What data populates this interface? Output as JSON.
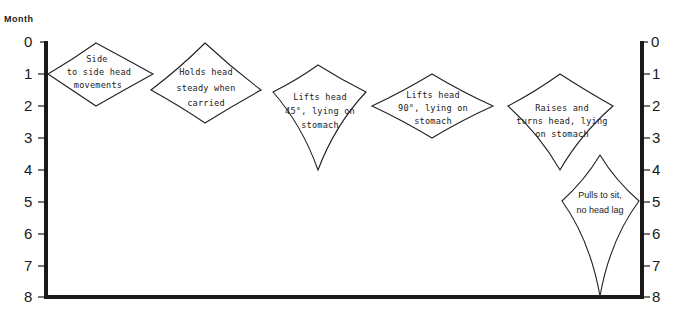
{
  "diagram": {
    "axis_title": "Month",
    "left_ticks": [
      "0",
      "1",
      "2",
      "3",
      "4",
      "5",
      "6",
      "7",
      "8"
    ],
    "right_ticks": [
      "0",
      "1",
      "2",
      "3",
      "4",
      "5",
      "6",
      "7",
      "8"
    ],
    "milestones": [
      {
        "id": "side-to-side",
        "lines": [
          "Side",
          "to side head",
          "movements"
        ],
        "start_month": 0,
        "peak_month": 1,
        "end_month": 2
      },
      {
        "id": "holds-head-steady",
        "lines": [
          "Holds head",
          "steady when",
          "carried"
        ],
        "start_month": 0,
        "peak_month": 1.5,
        "end_month": 2.5
      },
      {
        "id": "lifts-head-45",
        "lines": [
          "Lifts head",
          "45°, lying on",
          "stomach"
        ],
        "start_month": 0.75,
        "peak_month": 1.6,
        "end_month": 4
      },
      {
        "id": "lifts-head-90",
        "lines": [
          "Lifts head",
          "90°, lying on",
          "stomach"
        ],
        "start_month": 1,
        "peak_month": 2,
        "end_month": 3
      },
      {
        "id": "raises-turns-head",
        "lines": [
          "Raises and",
          "turns head, lying",
          "on stomach"
        ],
        "start_month": 1,
        "peak_month": 2,
        "end_month": 4
      },
      {
        "id": "pulls-to-sit",
        "lines": [
          "Pulls to sit,",
          "no head lag"
        ],
        "start_month": 3.5,
        "peak_month": 5,
        "end_month": 8
      }
    ]
  }
}
